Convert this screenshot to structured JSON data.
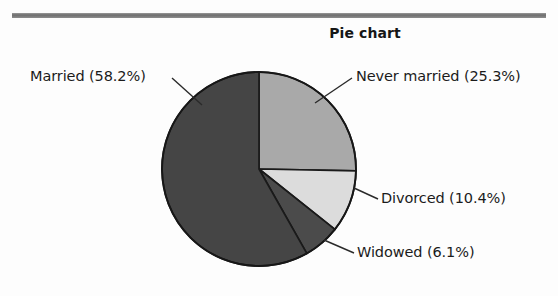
{
  "figure": {
    "title": "Pie chart",
    "has_top_rule": true
  },
  "chart_data": {
    "type": "pie",
    "title": "Pie chart",
    "xlabel": "",
    "ylabel": "",
    "categories": [
      "Never married",
      "Divorced",
      "Widowed",
      "Married"
    ],
    "values": [
      25.3,
      10.4,
      6.1,
      58.2
    ],
    "value_unit": "percent",
    "start_angle_deg": 0,
    "direction": "clockwise",
    "legend": "none",
    "labels_position": "outside-with-leader-lines",
    "slices": [
      {
        "name": "Never married",
        "label": "Never married (25.3%)",
        "value": 25.3,
        "color": "#a9a9a9",
        "start_deg": 0.0,
        "end_deg": 91.08
      },
      {
        "name": "Divorced",
        "label": "Divorced (10.4%)",
        "value": 10.4,
        "color": "#dcdcdc",
        "start_deg": 91.08,
        "end_deg": 128.52
      },
      {
        "name": "Widowed",
        "label": "Widowed (6.1%)",
        "value": 6.1,
        "color": "#4b4b4b",
        "start_deg": 128.52,
        "end_deg": 150.48
      },
      {
        "name": "Married",
        "label": "Married (58.2%)",
        "value": 58.2,
        "color": "#454545",
        "start_deg": 150.48,
        "end_deg": 360.0
      }
    ],
    "colors": {
      "never_married": "#a9a9a9",
      "divorced": "#dcdcdc",
      "widowed": "#4b4b4b",
      "married": "#454545",
      "outline": "#1a1a1a",
      "background": "#fdfdfd",
      "rule": "#6e6e6e",
      "text": "#1b1b1b"
    }
  },
  "labels": {
    "married": "Married (58.2%)",
    "never_married": "Never married (25.3%)",
    "divorced": "Divorced (10.4%)",
    "widowed": "Widowed (6.1%)"
  }
}
